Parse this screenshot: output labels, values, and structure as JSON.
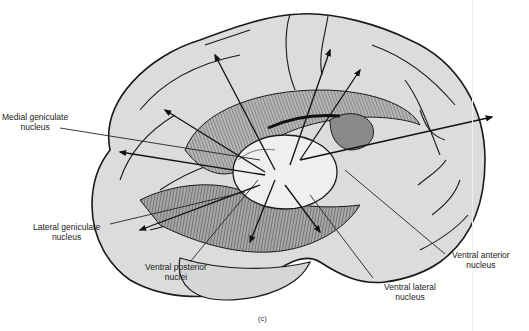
{
  "figure": {
    "panel_label": "(c)",
    "colors": {
      "cortex_fill": "#dcdcdc",
      "thalamus_fill": "#efefef",
      "hatched_fill": "#9a9a9a",
      "outline": "#1a1a1a"
    }
  },
  "labels": {
    "medial_geniculate": {
      "line1": "Medial geniculate",
      "line2": "nucleus"
    },
    "lateral_geniculate": {
      "line1": "Lateral geniculate",
      "line2": "nucleus"
    },
    "ventral_posterior": {
      "line1": "Ventral posterior",
      "line2": "nuclei"
    },
    "ventral_lateral": {
      "line1": "Ventral lateral",
      "line2": "nucleus"
    },
    "ventral_anterior": {
      "line1": "Ventral anterior",
      "line2": "nucleus"
    }
  }
}
